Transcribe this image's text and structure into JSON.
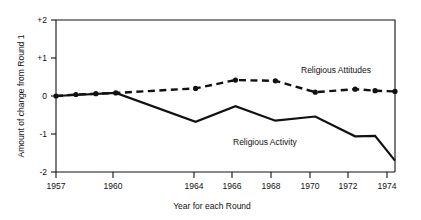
{
  "chart_data": {
    "type": "line",
    "title": "",
    "xlabel": "Year for each Round",
    "ylabel": "Amount of change from Round 1",
    "xlim": [
      1957,
      1974
    ],
    "ylim": [
      -2,
      2
    ],
    "grid": false,
    "legend_position": "inline-annotation",
    "xtick_labels": [
      "1957",
      "1960",
      "1964",
      "1966",
      "1968",
      "1970",
      "1972",
      "1974"
    ],
    "xtick_values": [
      1957,
      1960,
      1964,
      1966,
      1968,
      1970,
      1972,
      1974
    ],
    "ytick_labels": [
      "+2",
      "+1",
      "0",
      "-1",
      "-2"
    ],
    "ytick_values": [
      2,
      1,
      0,
      -1,
      -2
    ],
    "series": [
      {
        "name": "Religious Attitudes",
        "style": "dashed",
        "markers": "filled-circle",
        "x": [
          1957,
          1958,
          1959,
          1960,
          1964,
          1966,
          1968,
          1970,
          1972,
          1973,
          1974
        ],
        "values": [
          0.0,
          0.04,
          0.06,
          0.08,
          0.2,
          0.42,
          0.4,
          0.1,
          0.18,
          0.14,
          0.12
        ]
      },
      {
        "name": "Religious Activity",
        "style": "solid",
        "markers": "none",
        "x": [
          1957,
          1960,
          1964,
          1966,
          1968,
          1970,
          1972,
          1973,
          1974
        ],
        "values": [
          0.0,
          0.08,
          -0.68,
          -0.27,
          -0.65,
          -0.54,
          -1.06,
          -1.05,
          -1.7
        ]
      }
    ],
    "annotations": [
      {
        "text": "Religious  Attitudes",
        "x": 1970.2,
        "y": 0.62
      },
      {
        "text": "Religious Activity",
        "x": 1967.6,
        "y": -0.85
      }
    ]
  }
}
